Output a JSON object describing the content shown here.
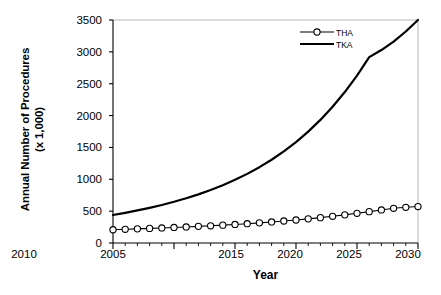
{
  "chart_data": {
    "type": "line",
    "title": "",
    "xlabel": "Year",
    "ylabel_line1": "Annual Number of Procedures",
    "ylabel_line2": "(x 1,000)",
    "xlim": [
      2005,
      2030
    ],
    "ylim": [
      0,
      3500
    ],
    "ytick_interval": 500,
    "xtick_major_interval": 5,
    "xtick_minor_interval": 1,
    "grid": false,
    "legend_position": "top-right",
    "yticks": [
      "0",
      "500",
      "1000",
      "1500",
      "2000",
      "2500",
      "3000",
      "3500"
    ],
    "xticks": [
      "2005",
      "2010",
      "2015",
      "2020",
      "2025",
      "2030"
    ],
    "x": [
      2005,
      2006,
      2007,
      2008,
      2009,
      2010,
      2011,
      2012,
      2013,
      2014,
      2015,
      2016,
      2017,
      2018,
      2019,
      2020,
      2021,
      2022,
      2023,
      2024,
      2025,
      2026,
      2027,
      2028,
      2029,
      2030
    ],
    "series": [
      {
        "name": "THA",
        "marker": "open-circle",
        "color": "#000000",
        "values": [
          208,
          215,
          222,
          229,
          236,
          244,
          252,
          261,
          270,
          280,
          291,
          303,
          316,
          330,
          345,
          361,
          379,
          398,
          419,
          442,
          466,
          492,
          519,
          545,
          560,
          572
        ]
      },
      {
        "name": "TKA",
        "marker": "none",
        "color": "#000000",
        "values": [
          440,
          474,
          511,
          552,
          597,
          647,
          702,
          763,
          831,
          907,
          991,
          1085,
          1190,
          1307,
          1438,
          1584,
          1748,
          1932,
          2138,
          2369,
          2628,
          2918,
          3028,
          3160,
          3320,
          3500
        ]
      }
    ],
    "legend": [
      {
        "label": "THA",
        "marker": "open-circle"
      },
      {
        "label": "TKA",
        "marker": "line"
      }
    ]
  }
}
